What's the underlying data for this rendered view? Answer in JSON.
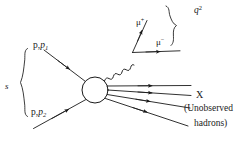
{
  "figure": {
    "background_color": "#ffffff",
    "stroke_color": "#1a1a1a",
    "text_color": "#1a1a1a"
  },
  "labels": {
    "mandelstam_s": "s",
    "incoming_top_particle": "p,",
    "incoming_top_momentum": "p",
    "incoming_top_momentum_index": "1",
    "incoming_bottom_particle": "p,",
    "incoming_bottom_momentum": "p",
    "incoming_bottom_momentum_index": "2",
    "muon_plus": "μ",
    "muon_plus_charge": "+",
    "muon_minus": "μ",
    "muon_minus_charge": "−",
    "virtuality": "q",
    "virtuality_exponent": "2",
    "final_state": "X",
    "final_state_note_line1": "(Unobserved",
    "final_state_note_line2": "hadrons)"
  },
  "icons": {
    "blob": "interaction-blob-circle",
    "photon": "wavy-photon-line",
    "brace_left": "left-curly-brace",
    "brace_right": "right-curly-brace",
    "arrow": "arrowhead"
  },
  "geometry": {
    "canvas": {
      "width": 237,
      "height": 142
    },
    "blob": {
      "cx": 95,
      "cy": 90,
      "r": 13
    },
    "incoming_top": {
      "x1": 44,
      "y1": 50,
      "x2": 84,
      "y2": 81
    },
    "incoming_bottom": {
      "x1": 34,
      "y1": 128,
      "x2": 85,
      "y2": 100
    },
    "photon_start": {
      "x": 105,
      "y": 80
    },
    "photon_end": {
      "x": 133,
      "y": 52
    },
    "muon_plus_line": {
      "x1": 133,
      "y1": 52,
      "x2": 146,
      "y2": 22
    },
    "muon_minus_line": {
      "x1": 133,
      "y1": 52,
      "x2": 179,
      "y2": 51
    },
    "hadron_lines": [
      {
        "x1": 107,
        "y1": 86,
        "x2": 190,
        "y2": 86
      },
      {
        "x1": 107,
        "y1": 90,
        "x2": 190,
        "y2": 95
      },
      {
        "x1": 107,
        "y1": 94,
        "x2": 190,
        "y2": 107
      },
      {
        "x1": 106,
        "y1": 98,
        "x2": 188,
        "y2": 124
      }
    ],
    "brace_s": {
      "x": 24,
      "y_top": 48,
      "y_bottom": 117
    },
    "brace_q2": {
      "x_top": 166,
      "y_top": 6,
      "x_bottom": 188,
      "y_bottom": 44
    }
  }
}
